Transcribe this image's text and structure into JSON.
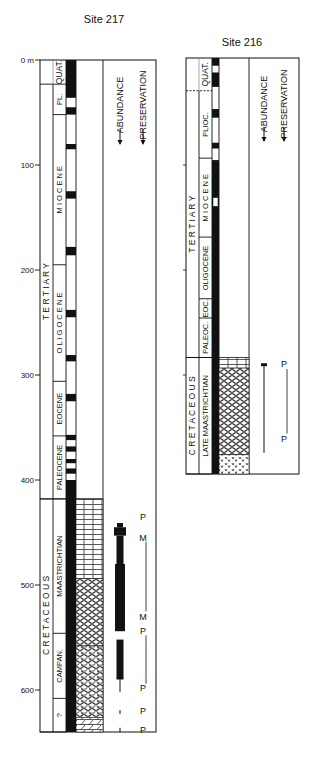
{
  "figure": {
    "type": "stratigraphic-columns",
    "depth_unit": "m",
    "depth_ticks": [
      {
        "label": "0 m",
        "depth": 0
      },
      {
        "label": "100",
        "depth": 100
      },
      {
        "label": "200",
        "depth": 200
      },
      {
        "label": "300",
        "depth": 300
      },
      {
        "label": "400",
        "depth": 400
      },
      {
        "label": "500",
        "depth": 500
      },
      {
        "label": "600",
        "depth": 600
      }
    ]
  },
  "site217": {
    "title": "Site 217",
    "headers": {
      "abundance": "ABUNDANCE",
      "preservation": "PRESERVATION"
    },
    "eras": [
      {
        "label": "QUAT.",
        "from": 0,
        "to": 23
      },
      {
        "label": "T E R T I A R Y",
        "from": 23,
        "to": 418
      },
      {
        "label": "C R E T A C E O U S",
        "from": 418,
        "to": 640
      }
    ],
    "epochs": [
      {
        "label": "PL.",
        "from": 23,
        "to": 52
      },
      {
        "label": "M I O C E N E",
        "from": 52,
        "to": 195
      },
      {
        "label": "O L I G O C E N E",
        "from": 195,
        "to": 306
      },
      {
        "label": "EOCENE",
        "from": 306,
        "to": 358
      },
      {
        "label": "PALEOCENE",
        "from": 358,
        "to": 418
      },
      {
        "label": "MAASTRICHTIAN",
        "from": 418,
        "to": 546
      },
      {
        "label": "CAMPAN.",
        "from": 546,
        "to": 608
      },
      {
        "label": "?",
        "from": 608,
        "to": 640
      }
    ],
    "recovery_cores": [
      [
        0,
        36
      ],
      [
        45,
        52
      ],
      [
        80,
        85
      ],
      [
        125,
        132
      ],
      [
        178,
        186
      ],
      [
        238,
        245
      ],
      [
        281,
        287
      ],
      [
        318,
        325
      ],
      [
        357,
        362
      ],
      [
        368,
        373
      ],
      [
        380,
        384
      ],
      [
        389,
        394
      ],
      [
        400,
        640
      ]
    ],
    "lithology": [
      {
        "type": "chalk-brick",
        "from": 418,
        "to": 494
      },
      {
        "type": "oval-ooze",
        "from": 494,
        "to": 558
      },
      {
        "type": "oval-chert",
        "from": 558,
        "to": 626
      },
      {
        "type": "limestone-diagonal",
        "from": 626,
        "to": 640
      }
    ],
    "abundance_bars": [
      {
        "from": 441,
        "to": 445,
        "width": 6,
        "kind": "line"
      },
      {
        "from": 445,
        "to": 453,
        "width": 12,
        "kind": "bar"
      },
      {
        "from": 453,
        "to": 480,
        "width": 7,
        "kind": "bar"
      },
      {
        "from": 480,
        "to": 544,
        "width": 10,
        "kind": "bar"
      },
      {
        "from": 552,
        "to": 590,
        "width": 7,
        "kind": "bar"
      },
      {
        "from": 590,
        "to": 602,
        "width": 1,
        "kind": "line"
      },
      {
        "from": 619,
        "to": 623,
        "width": 1,
        "kind": "line"
      },
      {
        "from": 636,
        "to": 640,
        "width": 1,
        "kind": "line"
      }
    ],
    "preservation": [
      {
        "label": "P",
        "depth": 435
      },
      {
        "label": "M",
        "depth": 455
      },
      {
        "label": "M",
        "depth": 530
      },
      {
        "label": "P",
        "depth": 544
      },
      {
        "label": "P",
        "depth": 598
      },
      {
        "label": "P",
        "depth": 620
      },
      {
        "label": "P",
        "depth": 638
      }
    ],
    "preservation_lines": [
      [
        459,
        525
      ],
      [
        548,
        594
      ]
    ]
  },
  "site216": {
    "title": "Site 216",
    "headers": {
      "abundance": "ABUNDANCE",
      "preservation": "PRESERVATION"
    },
    "eras": [
      {
        "label": "QUAT.",
        "from": 0,
        "to": 34
      },
      {
        "label": "T E R T I A R Y",
        "from": 34,
        "to": 311
      },
      {
        "label": "C R E T A C E O U S",
        "from": 311,
        "to": 432
      }
    ],
    "epochs": [
      {
        "label": "PLIOC.",
        "from": 34,
        "to": 104
      },
      {
        "label": "M I O C E N E",
        "from": 104,
        "to": 186
      },
      {
        "label": "OLIGOCENE",
        "from": 186,
        "to": 250
      },
      {
        "label": "EOC.",
        "from": 250,
        "to": 270
      },
      {
        "label": "PALEOC.",
        "from": 270,
        "to": 311
      },
      {
        "label": "LATE  MAASTRICHTIAN",
        "from": 311,
        "to": 432
      }
    ],
    "recovery_cores": [
      [
        0,
        8
      ],
      [
        15,
        30
      ],
      [
        53,
        62
      ],
      [
        88,
        94
      ],
      [
        106,
        432
      ]
    ],
    "recovery_gaps_white": [
      [
        145,
        154
      ]
    ],
    "lithology": [
      {
        "type": "chalk-brick",
        "from": 311,
        "to": 322
      },
      {
        "type": "oval-ooze",
        "from": 322,
        "to": 412
      },
      {
        "type": "volcanic-v",
        "from": 412,
        "to": 432
      }
    ],
    "abundance_bars": [
      {
        "from": 317,
        "to": 320,
        "width": 6,
        "kind": "bar"
      },
      {
        "from": 320,
        "to": 410,
        "width": 1,
        "kind": "line"
      }
    ],
    "preservation": [
      {
        "label": "P",
        "depth": 318
      },
      {
        "label": "P",
        "depth": 396
      }
    ],
    "preservation_lines": [
      [
        323,
        390
      ]
    ]
  }
}
